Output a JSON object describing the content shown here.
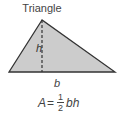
{
  "title": "Triangle",
  "labels": {
    "height": "h",
    "base": "b"
  },
  "formula": {
    "lhs": "A",
    "eq": "=",
    "numerator": "1",
    "denominator": "2",
    "rhs": "bh"
  },
  "colors": {
    "fill": "#cccccc",
    "stroke": "#333333"
  }
}
